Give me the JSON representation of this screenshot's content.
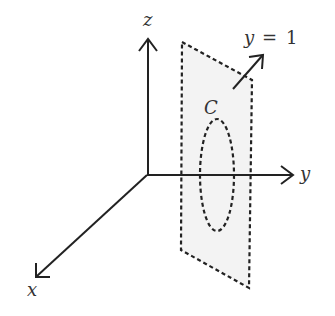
{
  "diagram": {
    "type": "3d-coordinate-system",
    "axes": {
      "x": {
        "label": "x"
      },
      "y": {
        "label": "y"
      },
      "z": {
        "label": "z"
      }
    },
    "plane": {
      "label_var": "y",
      "label_eq": "=",
      "label_val": "1",
      "fill": "#f3f3f3",
      "style": "dashed"
    },
    "curve": {
      "label": "C",
      "style": "dashed",
      "shape": "ellipse"
    },
    "colors": {
      "stroke": "#222222",
      "plane_fill": "#f3f3f3",
      "text": "#333333"
    }
  }
}
